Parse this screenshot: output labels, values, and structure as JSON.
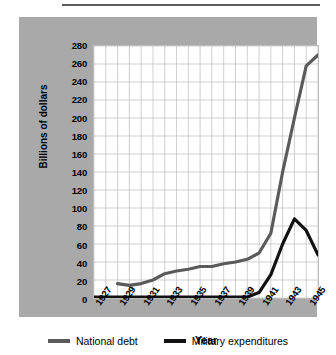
{
  "chart_data": {
    "type": "line",
    "title": "",
    "xlabel": "Year",
    "ylabel": "Billions of dollars",
    "xlim": [
      1927,
      1946
    ],
    "ylim": [
      0,
      280
    ],
    "ytick_step": 20,
    "yticks": [
      0,
      20,
      40,
      60,
      80,
      100,
      120,
      140,
      160,
      180,
      200,
      220,
      240,
      260,
      280
    ],
    "xticks": [
      1927,
      1929,
      1931,
      1933,
      1935,
      1937,
      1939,
      1941,
      1943,
      1945
    ],
    "xtick_labels": [
      "1927",
      "1929",
      "1931",
      "1933",
      "1935",
      "1937",
      "1939",
      "1941",
      "1943",
      "1945"
    ],
    "grid": true,
    "legend_position": "bottom",
    "x": [
      1927,
      1928,
      1929,
      1930,
      1931,
      1932,
      1933,
      1934,
      1935,
      1936,
      1937,
      1938,
      1939,
      1940,
      1941,
      1942,
      1943,
      1944,
      1945,
      1946
    ],
    "series": [
      {
        "name": "National debt",
        "color": "#5a5a5a",
        "values": [
          null,
          null,
          16,
          14,
          16,
          20,
          27,
          30,
          32,
          35,
          35,
          38,
          40,
          43,
          50,
          72,
          140,
          200,
          258,
          270
        ]
      },
      {
        "name": "Military expenditures",
        "color": "#111111",
        "values": [
          1,
          1,
          1,
          1,
          1,
          1,
          1,
          1,
          1,
          1,
          1,
          1,
          1,
          1,
          6,
          26,
          60,
          88,
          75,
          48
        ]
      }
    ]
  },
  "legend": {
    "items": [
      {
        "label": "National debt",
        "color": "#5a5a5a"
      },
      {
        "label": "Military expenditures",
        "color": "#111111"
      }
    ]
  }
}
